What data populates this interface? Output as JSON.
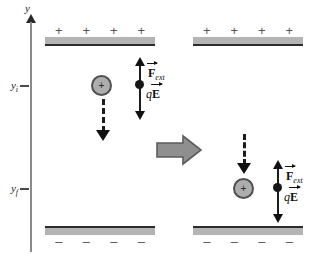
{
  "figure": {
    "type": "physics-diagram",
    "axis": {
      "label": "y",
      "orientation": "vertical-up",
      "ticks": [
        {
          "name": "y-initial",
          "label_main": "y",
          "label_sub": "i",
          "y_px": 85
        },
        {
          "name": "y-final",
          "label_main": "y",
          "label_sub": "f",
          "y_px": 188
        }
      ]
    },
    "plates": {
      "top": {
        "charge_sign": "+",
        "sign_count": 4,
        "fill_color": "#b4b4b4",
        "edge_color": "#2b2b2b"
      },
      "bottom": {
        "charge_sign": "–",
        "sign_count": 4,
        "fill_color": "#b4b4b4",
        "edge_color": "#2b2b2b"
      }
    },
    "particle": {
      "charge_sign": "+",
      "fill_color": "#adadad",
      "border_color": "#4f4f4f"
    },
    "vectors": {
      "force_external": {
        "symbol": "F",
        "subscript": "ext",
        "has_overarrow": true,
        "direction": "up"
      },
      "electric_force": {
        "prefix": "q",
        "symbol": "E",
        "has_overarrow": true,
        "direction": "down"
      }
    },
    "motion_arrow": {
      "style": "dashed",
      "direction": "down",
      "color": "#111111"
    },
    "transition_arrow": {
      "direction": "right",
      "fill_color": "#8f8f8f",
      "edge_color": "#5c5c5c"
    },
    "panels": [
      {
        "name": "panel-initial",
        "state": "initial",
        "particle_at": "y_i"
      },
      {
        "name": "panel-final",
        "state": "final",
        "particle_at": "y_f"
      }
    ]
  }
}
